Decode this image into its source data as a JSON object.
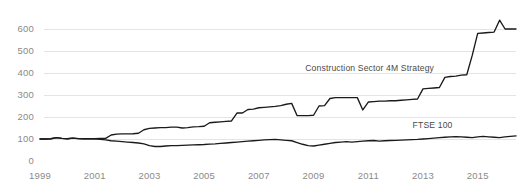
{
  "chart_data": {
    "type": "line",
    "title": "",
    "xlabel": "",
    "ylabel": "",
    "xlim": [
      1999,
      2016.4
    ],
    "ylim": [
      0,
      650
    ],
    "grid": true,
    "grid_axis": "y",
    "legend_position": "inline-annotation",
    "ytick_labels": [
      "0",
      "100",
      "200",
      "300",
      "400",
      "500",
      "600"
    ],
    "yticks": [
      0,
      100,
      200,
      300,
      400,
      500,
      600
    ],
    "xtick_labels": [
      "1999",
      "2001",
      "2003",
      "2005",
      "2007",
      "2009",
      "2011",
      "2013",
      "2015"
    ],
    "xticks": [
      1999,
      2001,
      2003,
      2005,
      2007,
      2009,
      2011,
      2013,
      2015
    ],
    "annotations": [
      {
        "name": "strategy-label",
        "text": "Construction Sector 4M Strategy",
        "x": 2011.05,
        "y": 408
      },
      {
        "name": "benchmark-label",
        "text": "FTSE 100",
        "x": 2013.35,
        "y": 150
      }
    ],
    "series": [
      {
        "name": "Construction Sector 4M Strategy",
        "color": "#1a1a1a",
        "x": [
          1999.0,
          1999.2,
          1999.4,
          1999.6,
          1999.8,
          2000.0,
          2000.2,
          2000.4,
          2000.6,
          2000.8,
          2001.0,
          2001.2,
          2001.4,
          2001.6,
          2001.8,
          2002.0,
          2002.2,
          2002.4,
          2002.6,
          2002.8,
          2003.0,
          2003.2,
          2003.4,
          2003.6,
          2003.8,
          2004.0,
          2004.2,
          2004.4,
          2004.6,
          2004.8,
          2005.0,
          2005.2,
          2005.4,
          2005.6,
          2005.8,
          2006.0,
          2006.2,
          2006.4,
          2006.6,
          2006.8,
          2007.0,
          2007.2,
          2007.4,
          2007.6,
          2007.8,
          2008.0,
          2008.2,
          2008.4,
          2008.6,
          2008.8,
          2009.0,
          2009.2,
          2009.4,
          2009.6,
          2009.8,
          2010.0,
          2010.2,
          2010.4,
          2010.6,
          2010.8,
          2011.0,
          2011.2,
          2011.4,
          2011.6,
          2011.8,
          2012.0,
          2012.2,
          2012.4,
          2012.6,
          2012.8,
          2013.0,
          2013.2,
          2013.4,
          2013.6,
          2013.8,
          2014.0,
          2014.2,
          2014.4,
          2014.6,
          2014.8,
          2015.0,
          2015.2,
          2015.4,
          2015.6,
          2015.8,
          2016.0,
          2016.2,
          2016.4
        ],
        "y": [
          100,
          100,
          101,
          106,
          103,
          101,
          104,
          102,
          101,
          101,
          101,
          103,
          103,
          118,
          122,
          123,
          123,
          124,
          126,
          142,
          148,
          150,
          152,
          152,
          154,
          154,
          150,
          152,
          155,
          156,
          158,
          174,
          176,
          178,
          180,
          182,
          218,
          218,
          234,
          236,
          242,
          244,
          246,
          248,
          252,
          258,
          262,
          206,
          206,
          206,
          208,
          250,
          252,
          284,
          288,
          288,
          288,
          288,
          288,
          232,
          268,
          270,
          272,
          272,
          274,
          274,
          276,
          278,
          280,
          282,
          328,
          330,
          332,
          334,
          380,
          384,
          386,
          390,
          392,
          480,
          580,
          582,
          584,
          586,
          640,
          600,
          600,
          600
        ]
      },
      {
        "name": "FTSE 100",
        "color": "#1a1a1a",
        "x": [
          1999.0,
          1999.2,
          1999.4,
          1999.6,
          1999.8,
          2000.0,
          2000.2,
          2000.4,
          2000.6,
          2000.8,
          2001.0,
          2001.2,
          2001.4,
          2001.6,
          2001.8,
          2002.0,
          2002.2,
          2002.4,
          2002.6,
          2002.8,
          2003.0,
          2003.2,
          2003.4,
          2003.6,
          2003.8,
          2004.0,
          2004.2,
          2004.4,
          2004.6,
          2004.8,
          2005.0,
          2005.2,
          2005.4,
          2005.6,
          2005.8,
          2006.0,
          2006.2,
          2006.4,
          2006.6,
          2006.8,
          2007.0,
          2007.2,
          2007.4,
          2007.6,
          2007.8,
          2008.0,
          2008.2,
          2008.4,
          2008.6,
          2008.8,
          2009.0,
          2009.2,
          2009.4,
          2009.6,
          2009.8,
          2010.0,
          2010.2,
          2010.4,
          2010.6,
          2010.8,
          2011.0,
          2011.2,
          2011.4,
          2011.6,
          2011.8,
          2012.0,
          2012.2,
          2012.4,
          2012.6,
          2012.8,
          2013.0,
          2013.2,
          2013.4,
          2013.6,
          2013.8,
          2014.0,
          2014.2,
          2014.4,
          2014.6,
          2014.8,
          2015.0,
          2015.2,
          2015.4,
          2015.6,
          2015.8,
          2016.0,
          2016.2,
          2016.4
        ],
        "y": [
          100,
          100,
          101,
          106,
          103,
          101,
          104,
          102,
          101,
          101,
          101,
          98,
          96,
          92,
          90,
          88,
          86,
          84,
          82,
          78,
          70,
          66,
          66,
          68,
          70,
          70,
          71,
          72,
          73,
          74,
          75,
          77,
          78,
          80,
          82,
          84,
          86,
          88,
          90,
          92,
          94,
          96,
          97,
          98,
          96,
          94,
          92,
          84,
          76,
          70,
          68,
          72,
          76,
          80,
          84,
          86,
          88,
          86,
          88,
          90,
          92,
          93,
          90,
          92,
          93,
          94,
          95,
          96,
          97,
          98,
          100,
          102,
          104,
          106,
          108,
          110,
          111,
          110,
          108,
          106,
          110,
          112,
          110,
          108,
          106,
          110,
          112,
          114
        ]
      }
    ]
  }
}
